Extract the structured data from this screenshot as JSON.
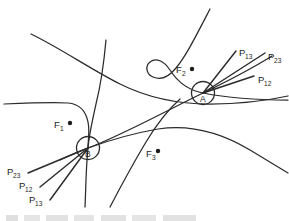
{
  "figure": {
    "kind": "geometric-diagram",
    "background_color": "#ffffff",
    "stroke_color": "#2b2b2b"
  },
  "nodes": [
    {
      "id": "A",
      "label": "A",
      "cx": 203,
      "cy": 93,
      "r": 11.5
    },
    {
      "id": "B",
      "label": "B",
      "cx": 88,
      "cy": 148,
      "r": 11.5
    }
  ],
  "focus_points": [
    {
      "id": "F1",
      "base": "F",
      "sub": "1",
      "label_x": 54,
      "label_y": 128,
      "dot_x": 70,
      "dot_y": 123,
      "dot_r": 2.2
    },
    {
      "id": "F2",
      "base": "F",
      "sub": "2",
      "label_x": 176,
      "label_y": 73,
      "dot_x": 192,
      "dot_y": 69,
      "dot_r": 2.2
    },
    {
      "id": "F3",
      "base": "F",
      "sub": "3",
      "label_x": 146,
      "label_y": 157,
      "dot_x": 158,
      "dot_y": 151,
      "dot_r": 2.2
    }
  ],
  "ray_labels_node_a": [
    {
      "base": "P",
      "sub": "13",
      "x": 239,
      "y": 56
    },
    {
      "base": "P",
      "sub": "23",
      "x": 268,
      "y": 60
    },
    {
      "base": "P",
      "sub": "12",
      "x": 258,
      "y": 83
    }
  ],
  "ray_labels_node_b": [
    {
      "base": "P",
      "sub": "23",
      "x": 7,
      "y": 175
    },
    {
      "base": "P",
      "sub": "12",
      "x": 19,
      "y": 189
    },
    {
      "base": "P",
      "sub": "13",
      "x": 29,
      "y": 203
    }
  ],
  "rays": {
    "from_a": [
      {
        "name": "ray-a-p13",
        "d": "M 203 93 L 236 51"
      },
      {
        "name": "ray-a-p23",
        "d": "M 203 93 L 265 53"
      },
      {
        "name": "ray-a-p12",
        "d": "M 203 93 L 254 76"
      }
    ],
    "from_b": [
      {
        "name": "ray-b-p23",
        "d": "M 88 148 L 28 173"
      },
      {
        "name": "ray-b-p12",
        "d": "M 88 148 L 40 187"
      },
      {
        "name": "ray-b-p13",
        "d": "M 88 148 L 50 200"
      }
    ]
  },
  "curves": [
    {
      "name": "curve-upper-diagonal",
      "d": "M 31 34 C 60 48 92 70 120 84 C 152 100 182 104 210 104 C 240 104 265 101 288 96"
    },
    {
      "name": "curve-vertical-left",
      "d": "M 106 40 C 104 62 101 84 96 104 C 92 122 89 135 88 148 C 86 166 86 186 85 207"
    },
    {
      "name": "curve-horizontal-left",
      "d": "M 4 104 C 28 103 52 102 68 103 C 80 104 86 112 88 122 C 90 132 88 140 88 148"
    },
    {
      "name": "curve-u-around-f2",
      "d": "M 210 9 C 196 36 186 56 176 68 C 168 78 160 80 153 77 C 146 74 145 66 150 62 C 156 57 164 61 170 70 C 177 81 187 90 203 93 C 228 98 258 100 288 100"
    },
    {
      "name": "curve-through-b-to-a",
      "d": "M 60 160 C 72 154 80 151 88 148 C 120 136 160 114 203 93 C 230 80 256 66 272 56"
    },
    {
      "name": "curve-arc-lower-right",
      "d": "M 88 148 C 110 140 135 133 158 129 C 190 124 220 132 250 150 C 265 159 278 167 288 173"
    },
    {
      "name": "curve-rising-right",
      "d": "M 110 207 C 122 184 134 162 146 142 C 158 122 170 108 180 99"
    }
  ],
  "caption": {
    "visible_text": "",
    "note": "partial cut-off line of text at very bottom edge, illegible"
  }
}
